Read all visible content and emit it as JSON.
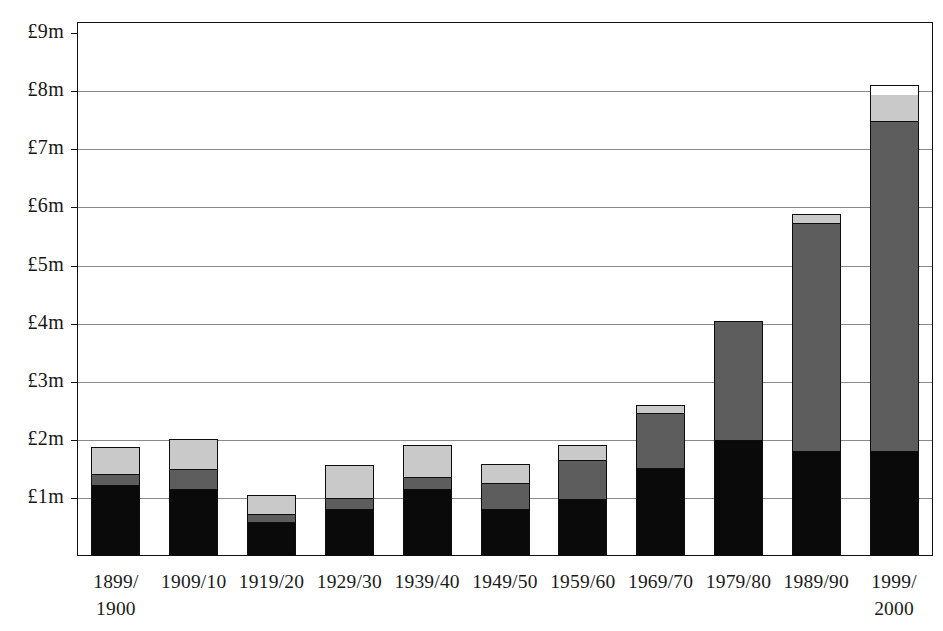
{
  "chart_data": {
    "type": "bar",
    "subtype": "stacked-bar",
    "title": "",
    "subtitle": "",
    "xlabel": "",
    "ylabel": "",
    "currency": "GBP",
    "unit": "£m",
    "ylim": [
      0,
      9
    ],
    "y_ticks": [
      1,
      2,
      3,
      4,
      5,
      6,
      7,
      8,
      9
    ],
    "y_tick_labels": [
      "£1m",
      "£2m",
      "£3m",
      "£4m",
      "£5m",
      "£6m",
      "£7m",
      "£8m",
      "£9m"
    ],
    "grid": true,
    "legend": "none",
    "categories": [
      "1899/\n1900",
      "1909/10",
      "1919/20",
      "1929/30",
      "1939/40",
      "1949/50",
      "1959/60",
      "1969/70",
      "1979/80",
      "1989/90",
      "1999/\n2000"
    ],
    "series": [
      {
        "name": "bottom-segment",
        "color": "#0a0a0a",
        "values": [
          1.22,
          1.16,
          0.59,
          0.81,
          1.16,
          0.81,
          0.98,
          1.52,
          2.0,
          1.81,
          1.81
        ]
      },
      {
        "name": "middle-segment",
        "color": "#5d5d5d",
        "values": [
          0.19,
          0.34,
          0.13,
          0.19,
          0.2,
          0.45,
          0.68,
          0.95,
          2.05,
          3.93,
          5.67
        ]
      },
      {
        "name": "upper-segment",
        "color": "#c9c9c9",
        "values": [
          0.47,
          0.52,
          0.33,
          0.57,
          0.55,
          0.33,
          0.25,
          0.13,
          0.0,
          0.14,
          0.47
        ]
      },
      {
        "name": "top-segment",
        "color": "#ffffff",
        "values": [
          0.0,
          0.0,
          0.0,
          0.0,
          0.0,
          0.0,
          0.0,
          0.0,
          0.0,
          0.0,
          0.15
        ]
      }
    ],
    "totals": [
      1.88,
      2.02,
      1.05,
      1.57,
      1.91,
      1.59,
      1.91,
      2.6,
      4.05,
      5.88,
      8.1
    ]
  }
}
